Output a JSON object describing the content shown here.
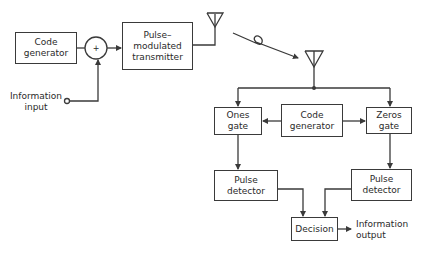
{
  "diagram": {
    "type": "block-diagram",
    "transmitter_side": {
      "code_generator": {
        "line1": "Code",
        "line2": "generator"
      },
      "summing_junction": {
        "symbol": "+"
      },
      "transmitter": {
        "line1": "Pulse–",
        "line2": "modulated",
        "line3": "transmitter"
      },
      "information_input": {
        "line1": "Information",
        "line2": "input"
      }
    },
    "receiver_side": {
      "ones_gate": {
        "line1": "Ones",
        "line2": "gate"
      },
      "code_generator": {
        "line1": "Code",
        "line2": "generator"
      },
      "zeros_gate": {
        "line1": "Zeros",
        "line2": "gate"
      },
      "pulse_detector_left": {
        "line1": "Pulse",
        "line2": "detector"
      },
      "pulse_detector_right": {
        "line1": "Pulse",
        "line2": "detector"
      },
      "decision": {
        "label": "Decision"
      },
      "information_output": {
        "line1": "Information",
        "line2": "output"
      }
    },
    "colors": {
      "line": "#3a3a3a",
      "background": "#ffffff"
    }
  }
}
